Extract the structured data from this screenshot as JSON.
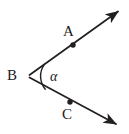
{
  "figure": {
    "type": "geometry-diagram",
    "background_color": "#ffffff",
    "stroke_color": "#231f20",
    "labels": {
      "ray_upper_point": "A",
      "vertex": "B",
      "ray_lower_point": "C",
      "angle_symbol": "α"
    },
    "geometry": {
      "vertex": {
        "x": 28,
        "y": 76
      },
      "ray_upper_tip": {
        "x": 122,
        "y": 9
      },
      "ray_lower_tip": {
        "x": 120,
        "y": 127
      },
      "point_A_dot": {
        "x": 73,
        "y": 45
      },
      "point_C_dot": {
        "x": 70,
        "y": 102
      },
      "arc_start": {
        "x": 44,
        "y": 64
      },
      "arc_end": {
        "x": 45,
        "y": 89
      },
      "dot_radius": 2.6,
      "stroke_width": 1.7
    }
  }
}
